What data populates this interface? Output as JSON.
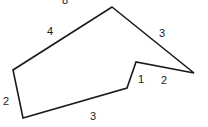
{
  "diagram": {
    "type": "polygon-with-side-lengths",
    "stroke_color": "#1a1a1a",
    "background": "#ffffff",
    "vertices": [
      [
        112,
        7
      ],
      [
        194,
        73
      ],
      [
        136,
        62
      ],
      [
        127,
        88
      ],
      [
        23,
        118
      ],
      [
        13,
        70
      ]
    ],
    "labels": [
      {
        "text": "8",
        "x": 66,
        "y": 4,
        "note": "partially cut off at top"
      },
      {
        "text": "4",
        "x": 50,
        "y": 35
      },
      {
        "text": "3",
        "x": 162,
        "y": 37
      },
      {
        "text": "1",
        "x": 141,
        "y": 83
      },
      {
        "text": "2",
        "x": 164,
        "y": 84
      },
      {
        "text": "2",
        "x": 7,
        "y": 105
      },
      {
        "text": "3",
        "x": 93,
        "y": 120
      }
    ]
  }
}
